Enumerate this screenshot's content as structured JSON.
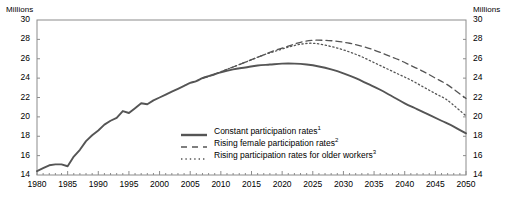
{
  "axis_unit_left": "Millions",
  "axis_unit_right": "Millions",
  "legend": [
    {
      "label": "Constant participation rates",
      "note": "1",
      "style": "solid",
      "name": "legend-item-constant"
    },
    {
      "label": "Rising female participation rates",
      "note": "2",
      "style": "dashed",
      "name": "legend-item-rising-female"
    },
    {
      "label": "Rising participation rates for older workers",
      "note": "3",
      "style": "dotted",
      "name": "legend-item-rising-older"
    }
  ],
  "chart_data": {
    "type": "line",
    "title": "",
    "xlabel": "",
    "ylabel": "Millions",
    "xlim": [
      1980,
      2050
    ],
    "ylim": [
      14,
      30
    ],
    "yticks": [
      14,
      16,
      18,
      20,
      22,
      24,
      26,
      28,
      30
    ],
    "xticks": [
      1980,
      1985,
      1990,
      1995,
      2000,
      2005,
      2010,
      2015,
      2020,
      2025,
      2030,
      2035,
      2040,
      2045,
      2050
    ],
    "grid": false,
    "legend_position": "inside-center-bottom",
    "series": [
      {
        "name": "Constant participation rates",
        "style": "solid",
        "color": "#555555",
        "x": [
          1980,
          1981,
          1982,
          1983,
          1984,
          1985,
          1986,
          1987,
          1988,
          1989,
          1990,
          1991,
          1992,
          1993,
          1994,
          1995,
          1996,
          1997,
          1998,
          1999,
          2000,
          2001,
          2002,
          2003,
          2004,
          2005,
          2006,
          2007,
          2008,
          2009,
          2010,
          2012,
          2014,
          2016,
          2018,
          2020,
          2022,
          2024,
          2026,
          2028,
          2030,
          2032,
          2034,
          2036,
          2038,
          2040,
          2042,
          2044,
          2046,
          2048,
          2050
        ],
        "y": [
          14.4,
          14.7,
          15.0,
          15.1,
          15.1,
          14.9,
          15.9,
          16.6,
          17.5,
          18.1,
          18.6,
          19.2,
          19.6,
          19.9,
          20.6,
          20.4,
          20.9,
          21.4,
          21.3,
          21.7,
          22.0,
          22.3,
          22.6,
          22.9,
          23.2,
          23.5,
          23.7,
          24.0,
          24.2,
          24.4,
          24.6,
          24.9,
          25.1,
          25.3,
          25.4,
          25.5,
          25.5,
          25.4,
          25.2,
          24.9,
          24.5,
          24.0,
          23.4,
          22.8,
          22.1,
          21.4,
          20.8,
          20.2,
          19.6,
          19.0,
          18.3
        ]
      },
      {
        "name": "Rising female participation rates",
        "style": "dashed",
        "color": "#555555",
        "x": [
          2007,
          2009,
          2011,
          2013,
          2015,
          2017,
          2019,
          2021,
          2023,
          2025,
          2027,
          2029,
          2031,
          2033,
          2035,
          2037,
          2039,
          2041,
          2043,
          2045,
          2047,
          2050
        ],
        "y": [
          24.0,
          24.4,
          24.9,
          25.4,
          25.9,
          26.4,
          26.9,
          27.3,
          27.7,
          27.9,
          27.9,
          27.8,
          27.6,
          27.3,
          26.9,
          26.4,
          25.9,
          25.3,
          24.7,
          24.0,
          23.3,
          21.9
        ]
      },
      {
        "name": "Rising participation rates for older workers",
        "style": "dotted",
        "color": "#555555",
        "x": [
          2007,
          2009,
          2011,
          2013,
          2015,
          2017,
          2019,
          2021,
          2023,
          2025,
          2027,
          2029,
          2031,
          2033,
          2035,
          2037,
          2039,
          2041,
          2043,
          2045,
          2047,
          2050
        ],
        "y": [
          24.0,
          24.4,
          24.9,
          25.4,
          25.9,
          26.4,
          26.8,
          27.2,
          27.5,
          27.6,
          27.4,
          27.1,
          26.7,
          26.2,
          25.6,
          25.0,
          24.4,
          23.8,
          23.1,
          22.4,
          21.7,
          20.1
        ]
      }
    ]
  }
}
